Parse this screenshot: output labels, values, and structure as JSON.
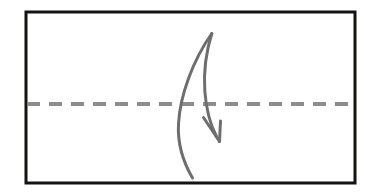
{
  "figure": {
    "background_color": "#ffffff",
    "canvas": {
      "width": 373,
      "height": 194
    }
  },
  "frame": {
    "name": "rectangular-border",
    "stroke_color": "#15120f",
    "stroke_width": 3,
    "fill": "none",
    "x": 26,
    "y": 12,
    "width": 329,
    "height": 171
  },
  "centerline": {
    "name": "horizontal-dashed-centerline",
    "stroke_color": "#8d8d8d",
    "stroke_width": 4,
    "dash_length": 13,
    "gap_length": 9,
    "y": 104,
    "x_start": 27,
    "x_end": 355,
    "orientation": "horizontal"
  },
  "arrow": {
    "name": "hand-drawn-curved-arrow",
    "stroke_color": "#6e6e6e",
    "stroke_width": 3,
    "fill": "none",
    "direction": "down-right",
    "description": "hook shaped curve rising from lower left, peaking at top then sweeping down and right to an arrowhead below the dashed line",
    "tail_point": {
      "x": 192,
      "y": 178
    },
    "peak_point": {
      "x": 212,
      "y": 33
    },
    "tip_point": {
      "x": 219,
      "y": 141
    },
    "path_outer": "M 192.5 178 C 182 160 177.5 142 178.5 124 C 179.8 96 193 60 211.8 33.5",
    "path_inner": "M 211.8 33.5 C 206 52 203.5 72 204.8 91 C 206.2 110 210.5 125 216.5 136.5",
    "arrowhead": {
      "name": "arrowhead-barbs",
      "left_barb": "M 219.5 141.5 L 203.5 117.5",
      "right_barb": "M 219.5 141.5 L 220.5 121.0",
      "tip": {
        "x": 219.5,
        "y": 141.5
      }
    }
  }
}
